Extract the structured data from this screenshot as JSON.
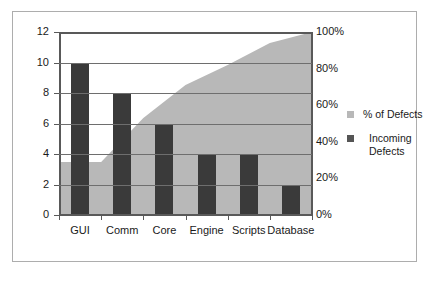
{
  "chart_data": {
    "type": "bar",
    "title": "",
    "subtitle": "",
    "xlabel": "",
    "ylabel": "",
    "y2label": "",
    "categories": [
      "GUI",
      "Comm",
      "Core",
      "Engine",
      "Scripts",
      "Database"
    ],
    "series": [
      {
        "name": "Incoming Defects",
        "type": "bar",
        "color": "#3a3a3a",
        "axis": "left",
        "values": [
          10,
          8,
          6,
          4,
          4,
          2
        ]
      },
      {
        "name": "% of Defects",
        "type": "area",
        "color": "#b8b8b8",
        "axis": "right",
        "values": [
          29,
          53,
          71,
          82,
          94,
          100
        ]
      }
    ],
    "ylim": [
      0,
      12
    ],
    "yticks": [
      0,
      2,
      4,
      6,
      8,
      10,
      12
    ],
    "ytick_labels": [
      "0",
      "2",
      "4",
      "6",
      "8",
      "10",
      "12"
    ],
    "y2lim": [
      0,
      100
    ],
    "y2ticks": [
      0,
      20,
      40,
      60,
      80,
      100
    ],
    "y2tick_labels": [
      "0%",
      "20%",
      "40%",
      "60%",
      "80%",
      "100%"
    ],
    "grid": true,
    "legend_position": "right",
    "total_defects": 34
  },
  "legend": {
    "items": [
      {
        "label": "% of Defects",
        "color": "#b8b8b8"
      },
      {
        "label": "Incoming",
        "label2": "Defects",
        "color": "#555555"
      }
    ]
  },
  "colors": {
    "bar": "#3a3a3a",
    "area": "#b8b8b8",
    "axis": "#595959",
    "grid": "#6e6e6e",
    "border": "#adadad",
    "background": "#ffffff",
    "text": "#1a1a1a"
  }
}
